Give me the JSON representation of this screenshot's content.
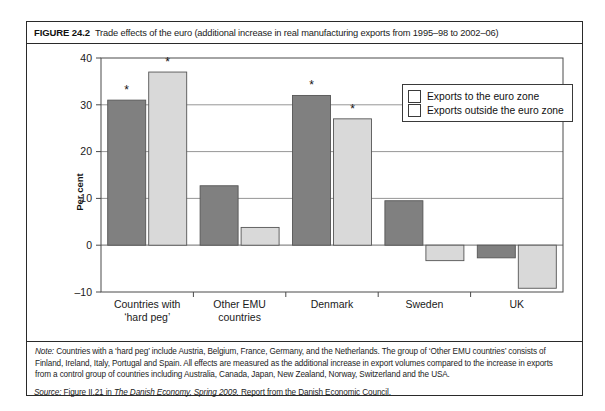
{
  "figure": {
    "label": "FIGURE 24.2",
    "caption": "Trade effects of the euro (additional increase in real manufacturing exports from 1995–98 to 2002–06)"
  },
  "legend": {
    "position": "top-right",
    "items": [
      {
        "label": "Exports to the euro zone",
        "color": "#808080"
      },
      {
        "label": "Exports outside the euro zone",
        "color": "#d9d9d9"
      }
    ]
  },
  "notes": {
    "lead": "Note:",
    "line1": " Countries with a ‘hard peg’ include Austria, Belgium, France, Germany, and the Netherlands. The group of ‘Other EMU countries’ consists of",
    "line2": "Finland, Ireland, Italy, Portugal and Spain. All effects are measured as the additional increase in export volumes compared to the increase in exports",
    "line3": "from a control group of countries including Australia, Canada, Japan, New Zealand, Norway, Switzerland and the USA.",
    "source_lead": "Source:",
    "source_pre": " Figure II.21 in ",
    "source_italic": "The Danish Economy, Spring 2009.",
    "source_post": " Report from the Danish Economic Council."
  },
  "chart_data": {
    "type": "bar",
    "title": "Trade effects of the euro (additional increase in real manufacturing exports from 1995–98 to 2002–06)",
    "xlabel": "",
    "ylabel": "Per cent",
    "ylim": [
      -10,
      40
    ],
    "yticks": [
      -10,
      0,
      10,
      20,
      30,
      40
    ],
    "ytick_labels": [
      "–10",
      "0",
      "10",
      "20",
      "30",
      "40"
    ],
    "grid": true,
    "grid_axis": "y",
    "categories": [
      "Countries with\n‘hard peg’",
      "Other EMU\ncountries",
      "Denmark",
      "Sweden",
      "UK"
    ],
    "category_lines": [
      [
        "Countries with",
        "‘hard peg’"
      ],
      [
        "Other EMU",
        "countries"
      ],
      [
        "Denmark",
        ""
      ],
      [
        "Sweden",
        ""
      ],
      [
        "UK",
        ""
      ]
    ],
    "series": [
      {
        "name": "Exports to the euro zone",
        "color": "#808080",
        "values": [
          31.0,
          12.7,
          32.0,
          9.5,
          -2.7
        ],
        "significant": [
          true,
          false,
          true,
          false,
          false
        ]
      },
      {
        "name": "Exports outside the euro zone",
        "color": "#d9d9d9",
        "values": [
          37.0,
          3.8,
          27.0,
          -3.3,
          -9.2
        ],
        "significant": [
          true,
          false,
          true,
          false,
          false
        ]
      }
    ],
    "annotation_marker": "*",
    "annotation_meaning": "statistically significant"
  }
}
